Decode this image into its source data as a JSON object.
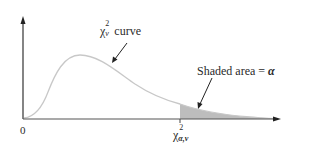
{
  "diagram": {
    "type": "chi-square distribution with right-tail shaded area",
    "curve_label": {
      "symbol": "χ",
      "superscript": "2",
      "subscript": "ν",
      "text": "curve"
    },
    "shaded_label": {
      "text": "Shaded area = ",
      "symbol": "α"
    },
    "origin_label": "0",
    "critical_value_label": {
      "symbol": "χ",
      "superscript": "2",
      "subscript": "α,ν"
    },
    "colors": {
      "axis": "#333333",
      "curve": "#c8c8c8",
      "shading": "#bdbdbd",
      "text": "#2a2a2a"
    }
  }
}
